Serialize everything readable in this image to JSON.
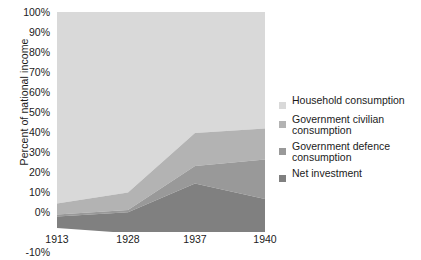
{
  "chart_data": {
    "type": "area",
    "title": "",
    "xlabel": "",
    "ylabel": "Percent of national income",
    "categories": [
      "1913",
      "1928",
      "1937",
      "1940"
    ],
    "x_tick_labels": [
      "1913",
      "1928",
      "1937",
      "1940"
    ],
    "y_tick_labels": [
      "100%",
      "90%",
      "80%",
      "70%",
      "60%",
      "50%",
      "40%",
      "30%",
      "20%",
      "10%",
      "0%",
      "-10%"
    ],
    "y_tick_values": [
      100,
      90,
      80,
      70,
      60,
      50,
      40,
      30,
      20,
      10,
      0,
      -10
    ],
    "ylim": [
      -10,
      100
    ],
    "grid": false,
    "stacked": true,
    "legend_position": "right",
    "series": [
      {
        "name": "Household consumption",
        "color": "#d9d9d9",
        "values": [
          87,
          82,
          55,
          53
        ],
        "cumulative_top": [
          100,
          100,
          100,
          100
        ]
      },
      {
        "name": "Government civilian consumption",
        "color": "#b3b3b3",
        "values": [
          5,
          8,
          15,
          14
        ],
        "cumulative_top": [
          13,
          18,
          45,
          47
        ]
      },
      {
        "name": "Government defence consumption",
        "color": "#999999",
        "values": [
          1,
          1,
          8,
          18
        ],
        "cumulative_top": [
          8,
          10,
          30,
          33
        ]
      },
      {
        "name": "Net investment",
        "color": "#808080",
        "values": [
          7,
          9,
          22,
          15
        ],
        "cumulative_top": [
          7,
          9,
          22,
          15
        ]
      }
    ]
  },
  "axis": {
    "y_title": "Percent of national income",
    "y_ticks": [
      "100%",
      "90%",
      "80%",
      "70%",
      "60%",
      "50%",
      "40%",
      "30%",
      "20%",
      "10%",
      "0%",
      "-10%"
    ],
    "x_ticks": [
      "1913",
      "1928",
      "1937",
      "1940"
    ]
  },
  "legend": {
    "items": [
      {
        "label": "Household consumption",
        "color": "#d9d9d9"
      },
      {
        "label": "Government civilian consumption",
        "color": "#b3b3b3"
      },
      {
        "label": "Government defence consumption",
        "color": "#999999"
      },
      {
        "label": "Net investment",
        "color": "#808080"
      }
    ]
  }
}
